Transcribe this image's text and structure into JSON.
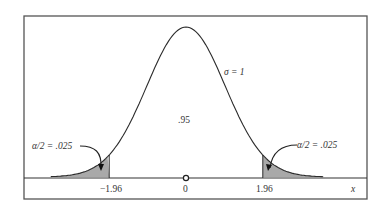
{
  "chart_data": {
    "type": "area",
    "title": "",
    "xlabel": "x",
    "ylabel": "",
    "distribution": {
      "mean": 0,
      "sigma": 1
    },
    "x_ticks": [
      "-1.96",
      "0",
      "1.96"
    ],
    "x_tick_values": [
      -1.96,
      0,
      1.96
    ],
    "xlim": [
      -3.7,
      3.7
    ],
    "shaded_regions": [
      {
        "from": -3.7,
        "to": -1.96,
        "area": 0.025,
        "label": "α/2 = .025"
      },
      {
        "from": 1.96,
        "to": 3.7,
        "area": 0.025,
        "label": "α/2 = .025"
      }
    ],
    "center_area": {
      "from": -1.96,
      "to": 1.96,
      "area": 0.95,
      "label": ".95"
    },
    "annotations": [
      "σ = 1",
      ".95",
      "α/2 = .025",
      "α/2 = .025"
    ],
    "grid": false,
    "legend": null
  },
  "labels": {
    "sigma": "σ = 1",
    "center": ".95",
    "left_tail": "α/2 = .025",
    "right_tail": "α/2 = .025",
    "tick_left": "−1.96",
    "tick_zero": "0",
    "tick_right": "1.96",
    "x_axis": "x"
  },
  "colors": {
    "frame": "#555555",
    "curve": "#2b2b2b",
    "shade": "#a9a9a9"
  }
}
